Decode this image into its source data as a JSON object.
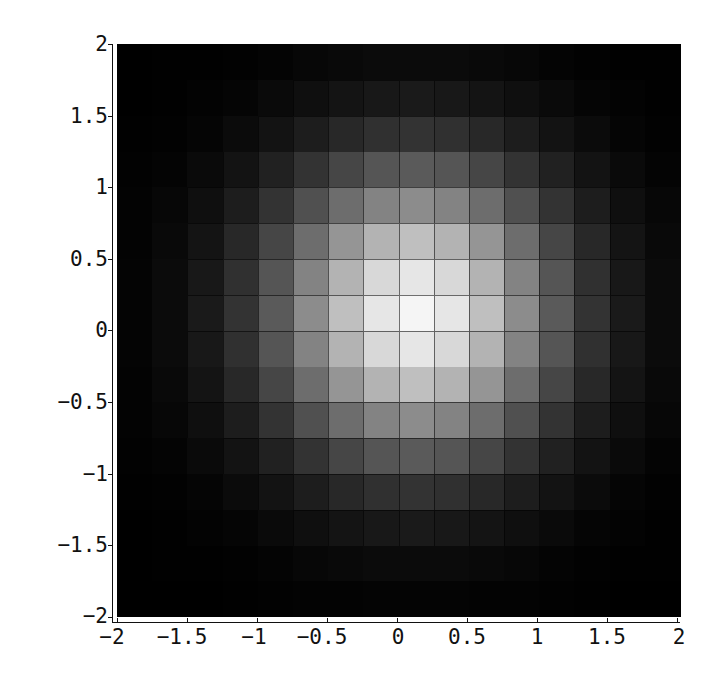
{
  "chart_data": {
    "type": "heatmap",
    "title": "",
    "xlabel": "",
    "ylabel": "",
    "xlim": [
      -2,
      2
    ],
    "ylim": [
      -2,
      2
    ],
    "grid": false,
    "legend": null,
    "colormap": "grayscale (black = low, white = high)",
    "cell_size": 0.25,
    "x_cell_edges": [
      -2,
      -1.75,
      -1.5,
      -1.25,
      -1,
      -0.75,
      -0.5,
      -0.25,
      0,
      0.25,
      0.5,
      0.75,
      1,
      1.25,
      1.5,
      1.75,
      2
    ],
    "y_cell_edges": [
      -2,
      -1.75,
      -1.5,
      -1.25,
      -1,
      -0.75,
      -0.5,
      -0.25,
      0,
      0.25,
      0.5,
      0.75,
      1,
      1.25,
      1.5,
      1.75,
      2
    ],
    "separable_factor": [
      0.0183,
      0.0468,
      0.1054,
      0.2096,
      0.3679,
      0.5698,
      0.7788,
      0.9394,
      1.0,
      0.9394,
      0.7788,
      0.5698,
      0.3679,
      0.2096,
      0.1054,
      0.0468
    ],
    "x_ticks": [
      -2,
      -1.5,
      -1,
      -0.5,
      0,
      0.5,
      1,
      1.5,
      2
    ],
    "y_ticks": [
      -2,
      -1.5,
      -1,
      -0.5,
      0,
      0.5,
      1,
      1.5,
      2
    ],
    "x_tick_labels": [
      "-2",
      "-1.5",
      "-1",
      "-0.5",
      "0",
      "0.5",
      "1",
      "1.5",
      "2"
    ],
    "y_tick_labels": [
      "-2",
      "-1.5",
      "-1",
      "-0.5",
      "0",
      "0.5",
      "1",
      "1.5",
      "2"
    ],
    "value_range": [
      0,
      1
    ],
    "peak": {
      "x": 0,
      "y": 0,
      "value": 1.0
    }
  },
  "axes": {
    "x_labels": [
      "−2",
      "−1.5",
      "−1",
      "−0.5",
      "0",
      "0.5",
      "1",
      "1.5",
      "2"
    ],
    "y_labels": [
      "2",
      "1.5",
      "1",
      "0.5",
      "0",
      "−0.5",
      "−1",
      "−1.5",
      "−2"
    ]
  }
}
